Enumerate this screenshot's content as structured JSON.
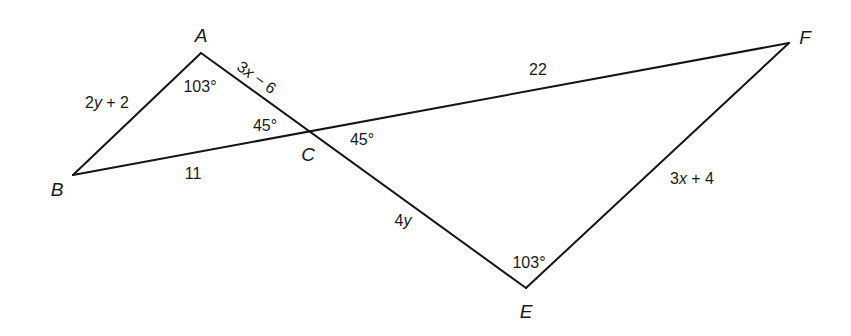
{
  "diagram": {
    "type": "geometry-figure",
    "vertices": [
      {
        "id": "A",
        "label": "A",
        "x": 201,
        "y": 53,
        "label_x": 201,
        "label_y": 35
      },
      {
        "id": "B",
        "label": "B",
        "x": 73,
        "y": 175,
        "label_x": 57,
        "label_y": 189
      },
      {
        "id": "C",
        "label": "C",
        "x": 310,
        "y": 132,
        "label_x": 308,
        "label_y": 154
      },
      {
        "id": "E",
        "label": "E",
        "x": 526,
        "y": 288,
        "label_x": 526,
        "label_y": 311
      },
      {
        "id": "F",
        "label": "F",
        "x": 789,
        "y": 43,
        "label_x": 805,
        "label_y": 37
      }
    ],
    "segments": [
      {
        "id": "AB",
        "from": "A",
        "to": "B"
      },
      {
        "id": "AE",
        "from": "A",
        "to": "E",
        "note": "passes through C"
      },
      {
        "id": "BF",
        "from": "B",
        "to": "F",
        "note": "passes through C"
      },
      {
        "id": "EF",
        "from": "E",
        "to": "F"
      }
    ],
    "side_labels": {
      "AB": "2y + 2",
      "AC": "3x − 6",
      "BC": "11",
      "CF": "22",
      "CE": "4y",
      "EF": "3x + 4"
    },
    "angle_labels": {
      "angle_A": "103°",
      "angle_ACB": "45°",
      "angle_ECF": "45°",
      "angle_E": "103°"
    },
    "label_positions": {
      "AB": {
        "x": 107,
        "y": 102
      },
      "AC": {
        "x": 257,
        "y": 77,
        "rotate": 36
      },
      "BC": {
        "x": 193,
        "y": 173
      },
      "CF": {
        "x": 538,
        "y": 69
      },
      "CE": {
        "x": 403,
        "y": 220
      },
      "EF": {
        "x": 692,
        "y": 178
      },
      "angle_A": {
        "x": 200,
        "y": 86
      },
      "angle_ACB": {
        "x": 265,
        "y": 125
      },
      "angle_ECF": {
        "x": 362,
        "y": 139
      },
      "angle_E": {
        "x": 529,
        "y": 262
      }
    },
    "colors": {
      "stroke": "#151515",
      "text": "#1a1a1a",
      "background": "#ffffff"
    }
  }
}
